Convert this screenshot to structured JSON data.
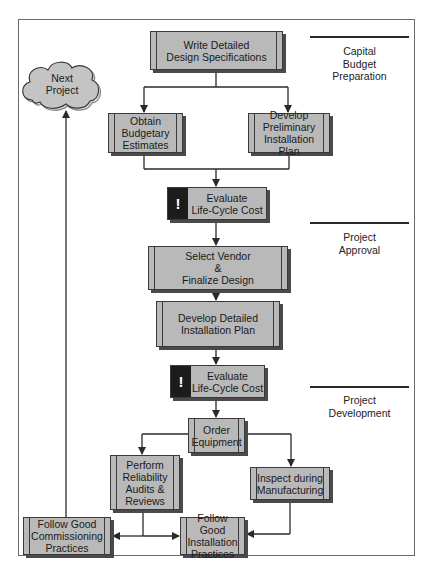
{
  "diagram": {
    "phases": [
      {
        "id": "capital-budget",
        "label": "Capital\nBudget\nPreparation"
      },
      {
        "id": "project-approval",
        "label": "Project\nApproval"
      },
      {
        "id": "project-development",
        "label": "Project\nDevelopment"
      }
    ],
    "cloud": {
      "label": "Next\nProject"
    },
    "nodes": {
      "write_specs": "Write Detailed\nDesign Specifications",
      "obtain_budget": "Obtain\nBudgetary\nEstimates",
      "develop_prelim": "Develop\nPreliminary\nInstallation Plan",
      "evaluate_1": "Evaluate\nLife-Cycle Cost",
      "select_vendor": "Select Vendor\n&\nFinalize Design",
      "develop_detailed": "Develop Detailed\nInstallation Plan",
      "evaluate_2": "Evaluate\nLife-Cycle Cost",
      "order_equipment": "Order\nEquipment",
      "perform_reliability": "Perform\nReliability\nAudits &\nReviews",
      "inspect_manufacturing": "Inspect during\nManufacturing",
      "commissioning": "Follow Good\nCommissioning\nPractices",
      "installation": "Follow Good\nInstallation\nPractices"
    },
    "evaluate_icon": "!",
    "colors": {
      "box_fill": "#b9b9b9",
      "box_border": "#3a3a3a",
      "alert_fill": "#1c1c1c",
      "line": "#2a2a2a"
    }
  }
}
